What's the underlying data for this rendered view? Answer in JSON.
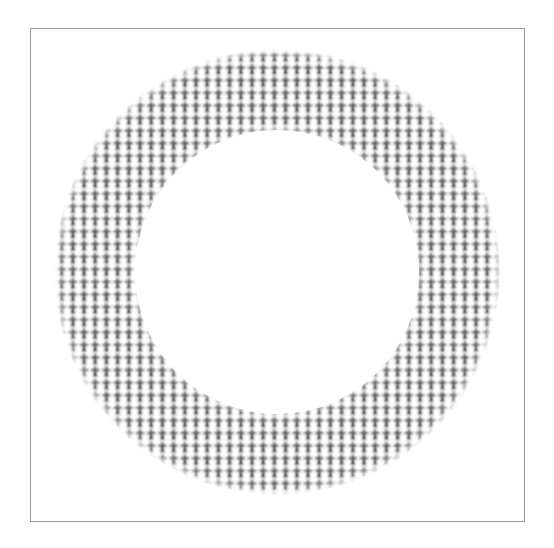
{
  "figure": {
    "title": "",
    "background_color": "#ffffff",
    "frame": {
      "stroke_color": "#9a9a9a",
      "stroke_width": 1,
      "x": 30,
      "y": 28,
      "width": 495,
      "height": 494
    }
  },
  "chart_data": {
    "type": "pie",
    "title": "",
    "subtitle": "",
    "xlabel": "",
    "ylabel": "",
    "grid": false,
    "legend_position": "none",
    "annotations": [],
    "tick_labels": [],
    "categories": [
      "ring"
    ],
    "values": [
      100
    ],
    "series": [
      {
        "name": "ring",
        "values": [
          100
        ],
        "start_angle_deg": 0,
        "sweep_angle_deg": 360,
        "fill": "pictogram-pattern",
        "fill_color": "#2b2b2b",
        "background_color": "#ffffff"
      }
    ],
    "geometry": {
      "center_x": 277,
      "center_y": 272,
      "outer_radius": 224,
      "inner_radius": 141,
      "hole_fraction": 0.63
    },
    "pattern": {
      "glyph_name": "cross-person-glyph",
      "tile_width": 11.2,
      "tile_height": 12.6,
      "glyph_color": "#262626",
      "tile_background": "#ffffff",
      "stagger": false
    }
  },
  "elements": {
    "donut_name": "donut-ring",
    "hole_name": "donut-hole",
    "frame_name": "figure-frame",
    "pattern_name": "pictogram-pattern"
  }
}
